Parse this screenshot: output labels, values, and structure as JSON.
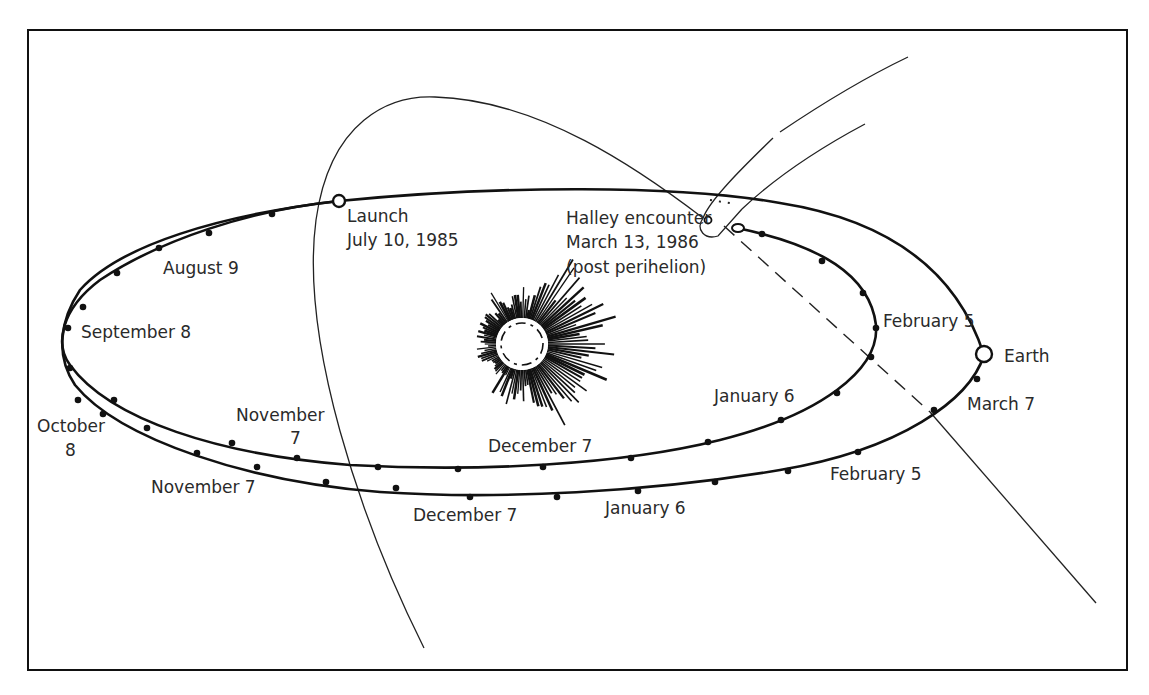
{
  "figure": {
    "type": "orbital-trajectory-diagram"
  },
  "labels": {
    "launch_title": "Launch",
    "launch_date": "July 10, 1985",
    "encounter_title": "Halley encounter",
    "encounter_date": "March 13, 1986",
    "encounter_note": "(post perihelion)",
    "earth": "Earth",
    "inner": {
      "aug": "August 9",
      "sep": "September 8",
      "nov_line1": "November",
      "nov_line2": "7",
      "dec": "December 7",
      "jan": "January 6",
      "feb": "February 5"
    },
    "outer": {
      "oct_line1": "October",
      "oct_line2": "8",
      "nov": "November 7",
      "dec": "December 7",
      "jan": "January 6",
      "feb": "February 5",
      "mar": "March 7"
    }
  },
  "bodies": {
    "sun": "sun-icon",
    "earth": "earth-marker",
    "launch": "launch-marker",
    "comet": "comet-nucleus"
  },
  "colors": {
    "ink": "#111111",
    "text": "#2a2a2a",
    "background": "#ffffff"
  }
}
